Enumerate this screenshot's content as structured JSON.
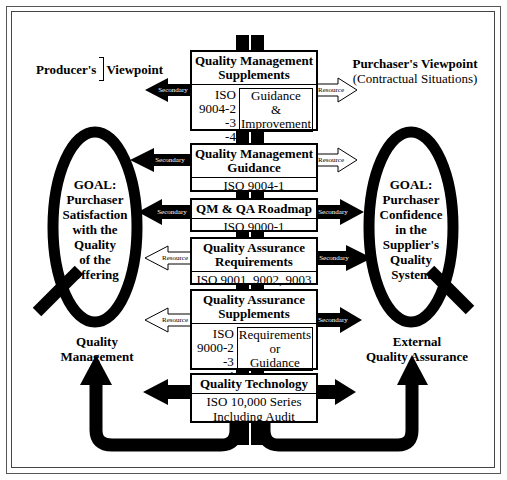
{
  "header": {
    "producer_line1": "Producer's",
    "producer_line2": "Supplier's",
    "producer_viewpoint": "Viewpoint",
    "purchaser_title": "Purchaser's Viewpoint",
    "purchaser_sub": "(Contractual Situations)"
  },
  "boxes": [
    {
      "title_line1": "Quality Management",
      "title_line2": "Supplements",
      "codes": [
        "ISO 9004-2",
        "-3",
        "-4"
      ],
      "note": [
        "Guidance",
        "&",
        "Improvement"
      ],
      "left_arrow": "Secondary",
      "right_arrow": "Resource"
    },
    {
      "title_line1": "Quality Management",
      "title_line2": "Guidance",
      "sub": "ISO 9004-1",
      "left_arrow": "Secondary",
      "right_arrow": "Resource"
    },
    {
      "title_line1": "QM & QA Roadmap",
      "sub": "ISO 9000-1",
      "left_arrow": "Secondary",
      "right_arrow": "Secondary"
    },
    {
      "title_line1": "Quality Assurance",
      "title_line2": "Requirements",
      "sub": "ISO 9001, 9002, 9003",
      "left_arrow": "Resource",
      "right_arrow": "Secondary"
    },
    {
      "title_line1": "Quality Assurance",
      "title_line2": "Supplements",
      "codes": [
        "ISO 9000-2",
        "-3",
        "-4"
      ],
      "note": [
        "Requirements",
        "or",
        "Guidance"
      ],
      "left_arrow": "Resource",
      "right_arrow": "Secondary"
    },
    {
      "title_line1": "Quality Technology",
      "sub_line1": "ISO 10,000 Series",
      "sub_line2": "Including Audit"
    }
  ],
  "goals": {
    "left": [
      "GOAL:",
      "Purchaser",
      "Satisfaction",
      "with the",
      "Quality",
      "of the",
      "Offering"
    ],
    "right": [
      "GOAL:",
      "Purchaser",
      "Confidence",
      "in the",
      "Supplier's",
      "Quality",
      "System"
    ]
  },
  "bottom_labels": {
    "left_line1": "Quality",
    "left_line2": "Management",
    "right_line1": "External",
    "right_line2": "Quality Assurance"
  },
  "colors": {
    "ink": "#000000",
    "paper": "#ffffff"
  }
}
